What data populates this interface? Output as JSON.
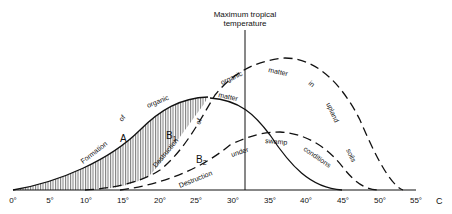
{
  "title": "Maximum tropical temperature",
  "title_line1": "Maximum tropical",
  "title_line2": "temperature",
  "axis": {
    "unit_label": "C",
    "ticks": [
      "0°",
      "5°",
      "10°",
      "15°",
      "20°",
      "25°",
      "30°",
      "35°",
      "40°",
      "45°",
      "50°",
      "55°"
    ]
  },
  "curves": {
    "A": {
      "label": "A",
      "style": "solid",
      "text": [
        "Formation",
        "of",
        "organic",
        "matter"
      ]
    },
    "B1": {
      "label": "B",
      "subscript": "1",
      "style": "dashed",
      "text": [
        "Destruction",
        "of",
        "organic",
        "matter",
        "in",
        "upland",
        "soils"
      ]
    },
    "B2": {
      "label": "B",
      "subscript": "2",
      "style": "dashed",
      "text": [
        "Destruction",
        "under",
        "swamp",
        "conditions"
      ]
    }
  },
  "words": {
    "formation": "Formation",
    "of_a": "of",
    "organic_a": "organic",
    "matter_a": "matter",
    "destruction_b1": "Destruction",
    "of_b1": "of",
    "organic_b1": "organic",
    "matter_b1": "matter",
    "in_b1": "in",
    "upland": "upland",
    "soils": "soils",
    "destruction_b2": "Destruction",
    "under": "under",
    "swamp": "swamp",
    "conditions": "conditions"
  },
  "colors": {
    "line": "#111111",
    "hatch": "#444444",
    "background": "#ffffff"
  }
}
